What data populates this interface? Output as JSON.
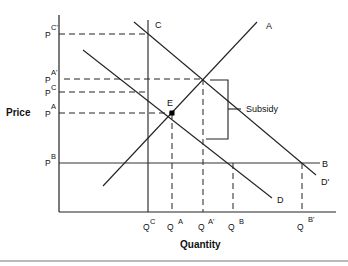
{
  "diagram": {
    "axes": {
      "y_label": "Price",
      "x_label": "Quantity"
    },
    "price_labels": [
      {
        "base": "P",
        "sup": "C'",
        "y": 34
      },
      {
        "base": "P",
        "sup": "A'",
        "y": 79
      },
      {
        "base": "P",
        "sup": "C",
        "y": 92
      },
      {
        "base": "P",
        "sup": "A",
        "y": 113
      },
      {
        "base": "P",
        "sup": "B",
        "y": 163
      }
    ],
    "quantity_labels": [
      {
        "base": "Q",
        "sup": "C",
        "x": 148
      },
      {
        "base": "Q",
        "sup": "A",
        "x": 172
      },
      {
        "base": "Q",
        "sup": "A'",
        "x": 203
      },
      {
        "base": "Q",
        "sup": "B",
        "x": 233
      },
      {
        "base": "Q",
        "sup": "B'",
        "x": 302
      }
    ],
    "curves": {
      "A": "A",
      "B": "B",
      "C": "C",
      "D": "D",
      "D_prime": "D'"
    },
    "equilibrium_label": "E",
    "subsidy_label": "Subsidy"
  }
}
